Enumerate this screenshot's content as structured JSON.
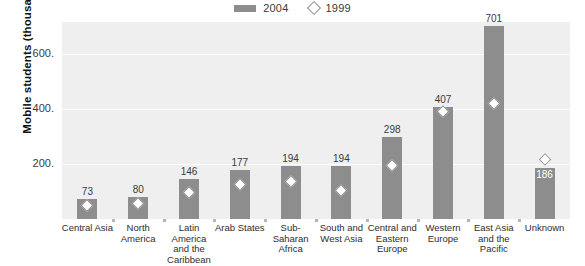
{
  "chart_data": {
    "type": "bar",
    "title": "",
    "subtitle": "",
    "xlabel": "",
    "ylabel": "Mobile students (thousands)",
    "ylim": [
      0,
      715
    ],
    "yticks": [
      200,
      400,
      600
    ],
    "ytick_labels": [
      "200.",
      "400.",
      "600."
    ],
    "grid": true,
    "legend_position": "top-center",
    "categories": [
      "Central Asia",
      "North America",
      "Latin America and the Caribbean",
      "Arab States",
      "Sub-Saharan Africa",
      "South and West Asia",
      "Central and Eastern Europe",
      "Western Europe",
      "East Asia and the Pacific",
      "Unknown"
    ],
    "category_lines": [
      [
        "Central Asia"
      ],
      [
        "North",
        "America"
      ],
      [
        "Latin",
        "America",
        "and the",
        "Caribbean"
      ],
      [
        "Arab States"
      ],
      [
        "Sub-",
        "Saharan",
        "Africa"
      ],
      [
        "South and",
        "West Asia"
      ],
      [
        "Central and",
        "Eastern",
        "Europe"
      ],
      [
        "Western",
        "Europe"
      ],
      [
        "East Asia",
        "and the",
        "Pacific"
      ],
      [
        "Unknown"
      ]
    ],
    "series": [
      {
        "name": "2004",
        "type": "bar",
        "color": "#8d8d8d",
        "values": [
          73,
          80,
          146,
          177,
          194,
          194,
          298,
          407,
          701,
          186
        ],
        "labels": [
          "73",
          "80",
          "146",
          "177",
          "194",
          "194",
          "298",
          "407",
          "701",
          "186"
        ],
        "label_inside": [
          false,
          false,
          false,
          false,
          false,
          false,
          false,
          false,
          false,
          true
        ]
      },
      {
        "name": "1999",
        "type": "marker",
        "marker": "diamond",
        "color": "#ffffff",
        "edge_color": "#8d8d8d",
        "values": [
          46,
          54,
          95,
          124,
          136,
          101,
          193,
          388,
          419,
          213
        ]
      }
    ]
  },
  "legend": {
    "items": [
      {
        "label": "2004",
        "marker": "bar-swatch",
        "color": "#8d8d8d"
      },
      {
        "label": "1999",
        "marker": "diamond-marker",
        "color": "#8d8d8d"
      }
    ]
  },
  "colors": {
    "bar": "#8d8d8d",
    "plot_background": "#efeff0",
    "gridline": "#ffffff",
    "page_background": "#ffffff",
    "text": "#2e2e2e"
  }
}
